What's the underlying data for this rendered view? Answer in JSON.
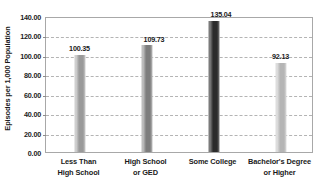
{
  "chart_data": {
    "type": "bar",
    "title": "",
    "xlabel": "",
    "ylabel": "Episodes per 1,000 Population",
    "ylim": [
      0,
      140
    ],
    "ytick_step": 20,
    "ytick_labels": [
      "0.00",
      "20.00",
      "40.00",
      "60.00",
      "80.00",
      "100.00",
      "120.00",
      "140.00"
    ],
    "ytick_values": [
      0,
      20,
      40,
      60,
      80,
      100,
      120,
      140
    ],
    "grid": true,
    "grid_axis": "y",
    "legend": "none",
    "categories": [
      "Less Than High School",
      "High School or GED",
      "Some College",
      "Bachelor's Degree or Higher"
    ],
    "category_lines": [
      [
        "Less Than",
        "High School"
      ],
      [
        "High School",
        "or GED"
      ],
      [
        "Some College",
        ""
      ],
      [
        "Bachelor's Degree",
        "or Higher"
      ]
    ],
    "values": [
      100.35,
      109.73,
      135.04,
      92.13
    ],
    "value_labels": [
      "100.35",
      "109.73",
      "135.04",
      "92.13"
    ],
    "bar_colors": [
      "#9a9a9a",
      "#7d7d7d",
      "#2b2b2b",
      "#b5b5b5"
    ],
    "bar_highlight_colors": [
      "#cfcfcf",
      "#bdbdbd",
      "#7a7a7a",
      "#dddddd"
    ],
    "plot_border_color": "#a8a8a8",
    "gridline_color": "#b4b4b4",
    "text_color": "#1a1a1a",
    "background_color": "#ffffff"
  }
}
